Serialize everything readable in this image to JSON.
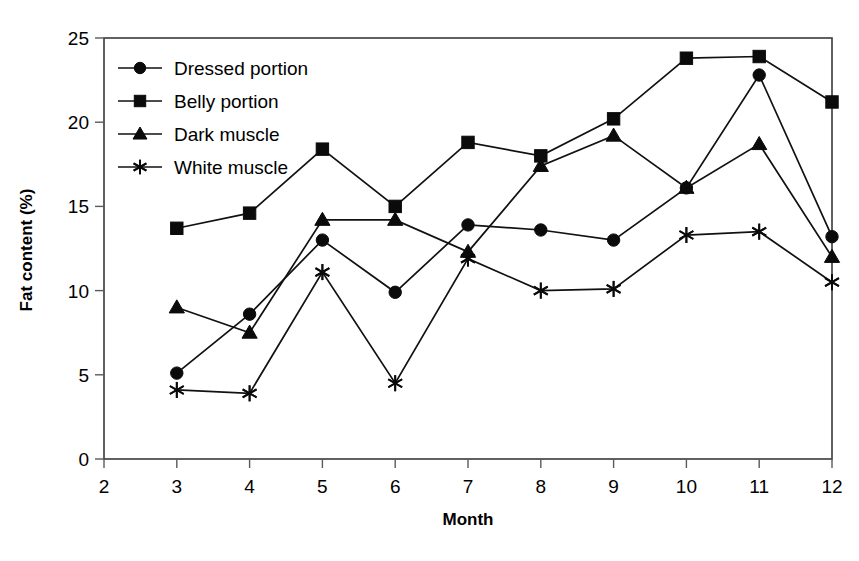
{
  "chart_data": {
    "type": "line",
    "title": "",
    "xlabel": "Month",
    "ylabel": "Fat content (%)",
    "x": [
      3,
      4,
      5,
      6,
      7,
      8,
      9,
      10,
      11,
      12
    ],
    "categories": [
      "3",
      "4",
      "5",
      "6",
      "7",
      "8",
      "9",
      "10",
      "11",
      "12"
    ],
    "xlim": [
      2,
      12
    ],
    "ylim": [
      0,
      25
    ],
    "xticks": [
      2,
      3,
      4,
      5,
      6,
      7,
      8,
      9,
      10,
      11,
      12
    ],
    "xtick_labels": [
      "2",
      "3",
      "4",
      "5",
      "6",
      "7",
      "8",
      "9",
      "10",
      "11",
      "12"
    ],
    "yticks": [
      0,
      5,
      10,
      15,
      20,
      25
    ],
    "ytick_labels": [
      "0",
      "5",
      "10",
      "15",
      "20",
      "25"
    ],
    "grid": false,
    "legend_position": "top-left inside plot",
    "series": [
      {
        "name": "Dressed portion",
        "marker": "circle",
        "values": [
          5.1,
          8.6,
          13.0,
          9.9,
          13.9,
          13.6,
          13.0,
          16.1,
          22.8,
          13.2
        ]
      },
      {
        "name": "Belly portion",
        "marker": "square",
        "values": [
          13.7,
          14.6,
          18.4,
          15.0,
          18.8,
          18.0,
          20.2,
          23.8,
          23.9,
          21.2
        ]
      },
      {
        "name": "Dark muscle",
        "marker": "triangle",
        "values": [
          9.0,
          7.5,
          14.2,
          14.2,
          12.3,
          17.4,
          19.2,
          16.1,
          18.7,
          12.0
        ]
      },
      {
        "name": "White muscle",
        "marker": "star",
        "values": [
          4.1,
          3.9,
          11.1,
          4.5,
          11.9,
          10.0,
          10.1,
          13.3,
          13.5,
          10.5
        ]
      }
    ]
  },
  "legend": {
    "entries": [
      {
        "label": "Dressed portion",
        "marker": "circle"
      },
      {
        "label": "Belly portion",
        "marker": "square"
      },
      {
        "label": "Dark muscle",
        "marker": "triangle"
      },
      {
        "label": "White muscle",
        "marker": "star"
      }
    ]
  },
  "colors": {
    "series": "#0b0b0b",
    "frame": "#3a3a3a",
    "background": "#ffffff"
  }
}
